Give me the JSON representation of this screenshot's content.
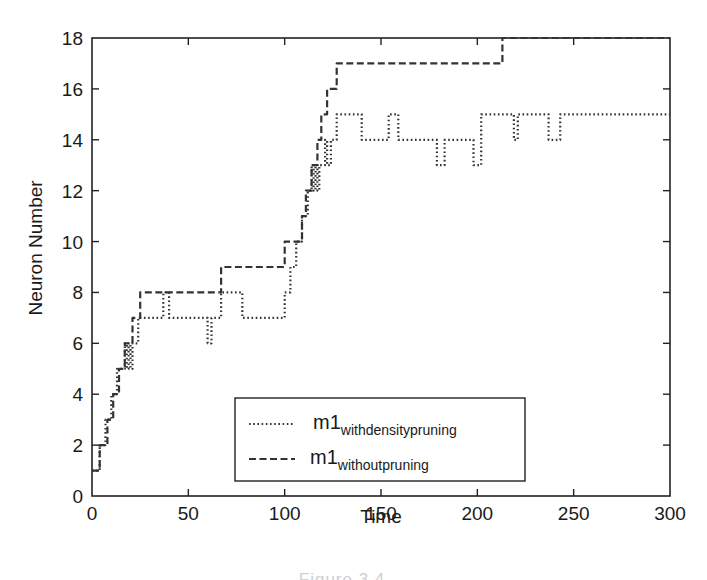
{
  "chart_data": {
    "type": "line",
    "title": "",
    "xlabel": "Time",
    "ylabel": "Neuron Number",
    "xlim": [
      0,
      300
    ],
    "ylim": [
      0,
      18
    ],
    "x_ticks": [
      0,
      50,
      100,
      150,
      200,
      250,
      300
    ],
    "y_ticks": [
      0,
      2,
      4,
      6,
      8,
      10,
      12,
      14,
      16,
      18
    ],
    "grid": false,
    "legend_position": "lower center (inside plot)",
    "step": true,
    "series": [
      {
        "name": "m1_withdensitypruning",
        "legend_main": "m1",
        "legend_sub": "withdensitypruning",
        "style": "dotted",
        "color": "#333333",
        "points": [
          [
            0,
            1
          ],
          [
            4,
            1
          ],
          [
            4,
            2
          ],
          [
            7,
            2
          ],
          [
            7,
            3
          ],
          [
            10,
            3
          ],
          [
            10,
            4
          ],
          [
            13,
            4
          ],
          [
            13,
            5
          ],
          [
            17,
            5
          ],
          [
            17,
            6
          ],
          [
            18,
            6
          ],
          [
            18,
            5
          ],
          [
            19,
            5
          ],
          [
            19,
            6
          ],
          [
            20,
            6
          ],
          [
            20,
            5
          ],
          [
            21,
            5
          ],
          [
            21,
            6
          ],
          [
            24,
            6
          ],
          [
            24,
            7
          ],
          [
            37,
            7
          ],
          [
            37,
            8
          ],
          [
            40,
            8
          ],
          [
            40,
            7
          ],
          [
            60,
            7
          ],
          [
            60,
            6
          ],
          [
            62,
            6
          ],
          [
            62,
            7
          ],
          [
            67,
            7
          ],
          [
            67,
            8
          ],
          [
            78,
            8
          ],
          [
            78,
            7
          ],
          [
            100,
            7
          ],
          [
            100,
            8
          ],
          [
            103,
            8
          ],
          [
            103,
            9
          ],
          [
            106,
            9
          ],
          [
            106,
            10
          ],
          [
            109,
            10
          ],
          [
            109,
            11
          ],
          [
            112,
            11
          ],
          [
            112,
            12
          ],
          [
            114,
            12
          ],
          [
            114,
            13
          ],
          [
            115,
            13
          ],
          [
            115,
            12
          ],
          [
            116,
            12
          ],
          [
            116,
            13
          ],
          [
            117,
            13
          ],
          [
            117,
            12
          ],
          [
            118,
            12
          ],
          [
            118,
            13
          ],
          [
            121,
            13
          ],
          [
            121,
            14
          ],
          [
            122,
            14
          ],
          [
            122,
            13
          ],
          [
            124,
            13
          ],
          [
            124,
            14
          ],
          [
            127,
            14
          ],
          [
            127,
            15
          ],
          [
            140,
            15
          ],
          [
            140,
            14
          ],
          [
            154,
            14
          ],
          [
            154,
            15
          ],
          [
            159,
            15
          ],
          [
            159,
            14
          ],
          [
            179,
            14
          ],
          [
            179,
            13
          ],
          [
            183,
            13
          ],
          [
            183,
            14
          ],
          [
            198,
            14
          ],
          [
            198,
            13
          ],
          [
            202,
            13
          ],
          [
            202,
            15
          ],
          [
            219,
            15
          ],
          [
            219,
            14
          ],
          [
            221,
            14
          ],
          [
            221,
            15
          ],
          [
            237,
            15
          ],
          [
            237,
            14
          ],
          [
            243,
            14
          ],
          [
            243,
            15
          ],
          [
            300,
            15
          ]
        ]
      },
      {
        "name": "m1_withoutpruning",
        "legend_main": "m1",
        "legend_sub": "withoutpruning",
        "style": "dashed",
        "color": "#333333",
        "points": [
          [
            0,
            1
          ],
          [
            4,
            1
          ],
          [
            4,
            2
          ],
          [
            8,
            2
          ],
          [
            8,
            3
          ],
          [
            11,
            3
          ],
          [
            11,
            4
          ],
          [
            14,
            4
          ],
          [
            14,
            5
          ],
          [
            17,
            5
          ],
          [
            17,
            6
          ],
          [
            21,
            6
          ],
          [
            21,
            7
          ],
          [
            25,
            7
          ],
          [
            25,
            8
          ],
          [
            67,
            8
          ],
          [
            67,
            9
          ],
          [
            100,
            9
          ],
          [
            100,
            10
          ],
          [
            109,
            10
          ],
          [
            109,
            11
          ],
          [
            111,
            11
          ],
          [
            111,
            12
          ],
          [
            114,
            12
          ],
          [
            114,
            13
          ],
          [
            117,
            13
          ],
          [
            117,
            14
          ],
          [
            119,
            14
          ],
          [
            119,
            15
          ],
          [
            122,
            15
          ],
          [
            122,
            16
          ],
          [
            127,
            16
          ],
          [
            127,
            17
          ],
          [
            213,
            17
          ],
          [
            213,
            18
          ],
          [
            300,
            18
          ]
        ]
      }
    ]
  },
  "legend": {
    "entries": [
      {
        "main": "m1",
        "sub": "withdensitypruning"
      },
      {
        "main": "m1",
        "sub": "withoutpruning"
      }
    ]
  },
  "caption_partial": "Figure 3.4 ..."
}
